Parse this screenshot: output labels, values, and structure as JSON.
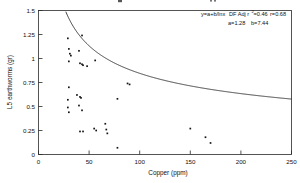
{
  "chart_data": {
    "type": "scatter",
    "title": "",
    "xlabel": "Copper (ppm)",
    "ylabel": "L5 earthworms (gr)",
    "xlim": [
      0,
      250
    ],
    "ylim": [
      0,
      1.5
    ],
    "xticks": [
      "0",
      "50",
      "100",
      "150",
      "200",
      "250"
    ],
    "xtick_values": [
      0,
      50,
      100,
      150,
      200,
      250
    ],
    "yticks": [
      "0",
      "0.25",
      "0.5",
      "0.75",
      "1",
      "1.25",
      "1.5"
    ],
    "ytick_values": [
      0,
      0.25,
      0.5,
      0.75,
      1,
      1.25,
      1.5
    ],
    "grid": false,
    "legend": "none",
    "points": [
      [
        29,
        1.21
      ],
      [
        30,
        1.1
      ],
      [
        31,
        1.05
      ],
      [
        32,
        1.03
      ],
      [
        30,
        0.97
      ],
      [
        43,
        1.24
      ],
      [
        40,
        1.08
      ],
      [
        41,
        0.95
      ],
      [
        43,
        0.94
      ],
      [
        44,
        0.93
      ],
      [
        48,
        0.92
      ],
      [
        56,
        0.98
      ],
      [
        30,
        0.7
      ],
      [
        29,
        0.57
      ],
      [
        29,
        0.49
      ],
      [
        30,
        0.44
      ],
      [
        38,
        0.62
      ],
      [
        41,
        0.6
      ],
      [
        42,
        0.59
      ],
      [
        40,
        0.51
      ],
      [
        43,
        0.46
      ],
      [
        41,
        0.24
      ],
      [
        44,
        0.24
      ],
      [
        55,
        0.27
      ],
      [
        57,
        0.25
      ],
      [
        66,
        0.32
      ],
      [
        67,
        0.26
      ],
      [
        68,
        0.22
      ],
      [
        78,
        0.07
      ],
      [
        78,
        0.58
      ],
      [
        88,
        0.74
      ],
      [
        90,
        0.73
      ],
      [
        150,
        0.27
      ],
      [
        165,
        0.18
      ],
      [
        170,
        0.12
      ]
    ],
    "fit": {
      "equation_label": "y=a+b/lnx",
      "model": "y = a + b/ln(x)",
      "a": 1.28,
      "b": 7.44,
      "note": "curve drawn as decreasing fit through scatter"
    },
    "annotations": {
      "line1_prefix": "y=a+b/lnx",
      "line1_stat_label": "DF Adj r",
      "line1_sup": "2",
      "line1_r2": "=0.46",
      "line1_r": "r=0.68",
      "line2_a": "a=1.28",
      "line2_b": "b=7.44"
    }
  }
}
